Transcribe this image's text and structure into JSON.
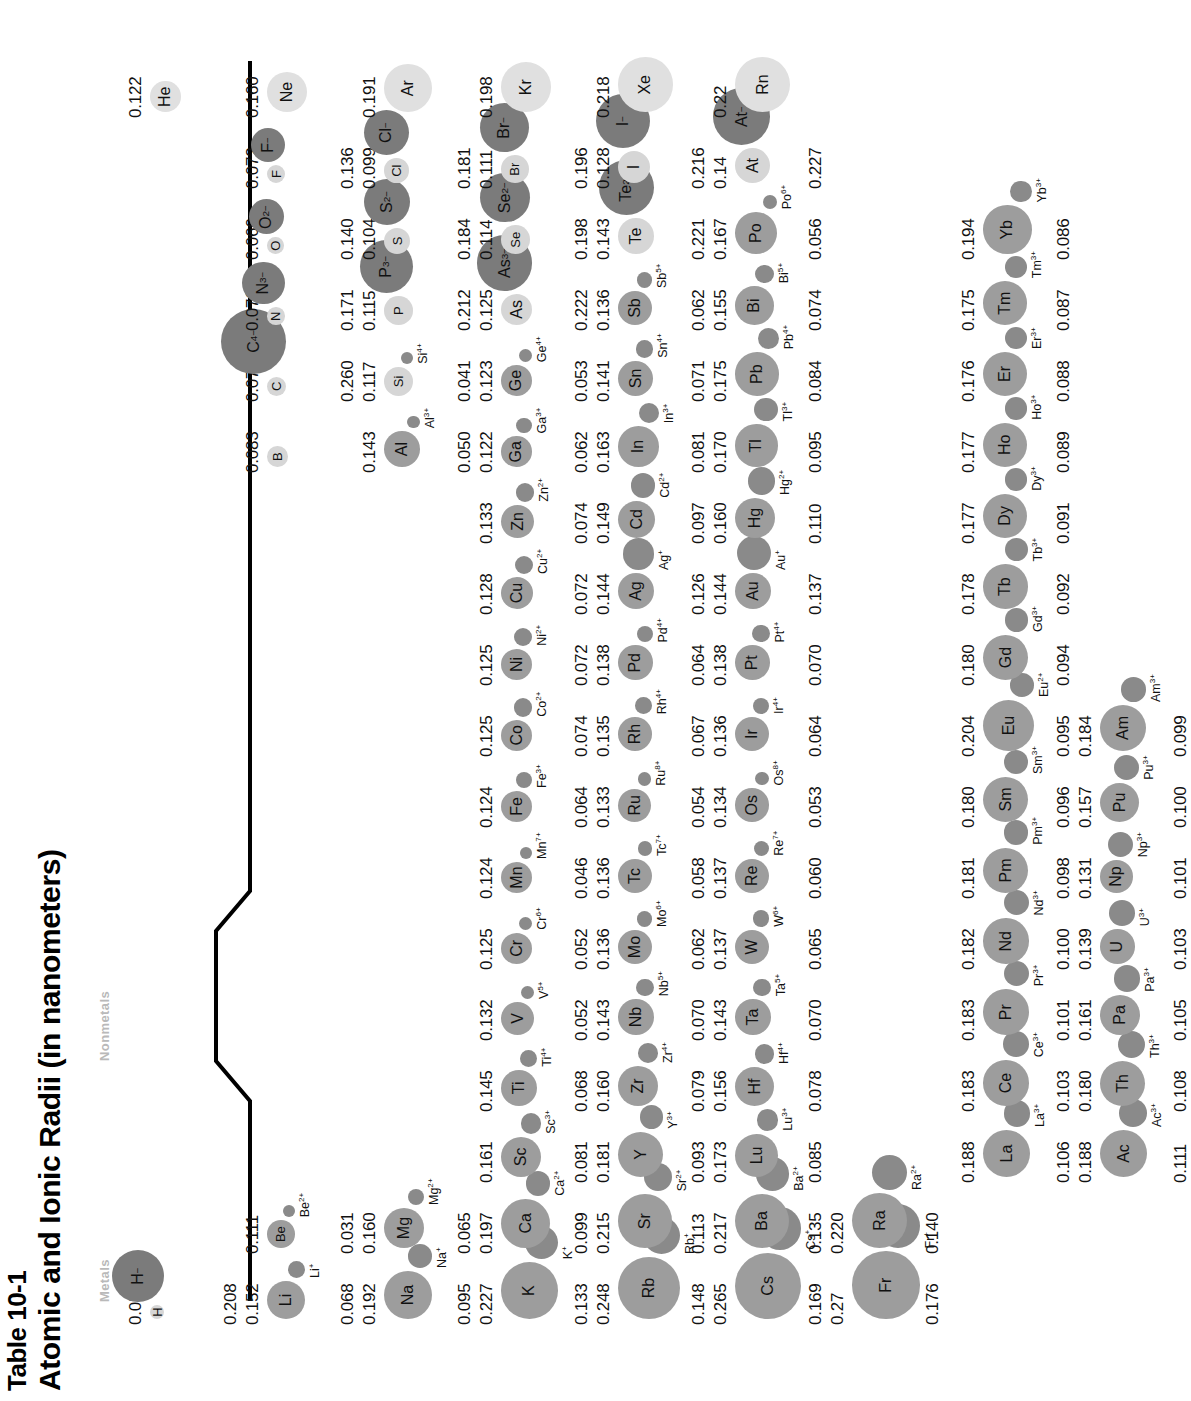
{
  "figure": {
    "table_number": "Table 10-1",
    "title": "Atomic and Ionic Radii (in nanometers)",
    "legend_metals": "Metals",
    "legend_nonmetals": "Nonmetals"
  },
  "chart_data": {
    "type": "table",
    "title": "Atomic and Ionic Radii (in nanometers)",
    "subtitle": "Table 10-1",
    "units": "nanometers",
    "legend": [
      "Metals",
      "Nonmetals"
    ],
    "encoding": {
      "atom_circle": "atomic radius (area/diameter proportional)",
      "ion_circle": "ionic radius (area/diameter proportional)",
      "metal_fill": "#9d9d9d",
      "nonmetal_fill": "#d6d6d6",
      "noblegas_fill": "#e0e0e0",
      "cation_fill": "#8a8a8a",
      "anion_fill": "#7b7b7b"
    },
    "columns": [
      "element",
      "atomic_radius",
      "ion",
      "ionic_radius",
      "class"
    ],
    "rows": [
      {
        "element": "H",
        "atomic_radius": "0.053",
        "ion": "H−",
        "ionic_radius": "0.208",
        "class": "nonmetal"
      },
      {
        "element": "He",
        "atomic_radius": "0.122",
        "ion": "",
        "ionic_radius": "",
        "class": "noblegas"
      },
      {
        "element": "Li",
        "atomic_radius": "0.152",
        "ion": "Li+",
        "ionic_radius": "0.068",
        "class": "metal"
      },
      {
        "element": "Be",
        "atomic_radius": "0.111",
        "ion": "Be2+",
        "ionic_radius": "0.031",
        "class": "metal"
      },
      {
        "element": "B",
        "atomic_radius": "0.083",
        "ion": "",
        "ionic_radius": "",
        "class": "nonmetal"
      },
      {
        "element": "C",
        "atomic_radius": "0.077",
        "ion": "C4−",
        "ionic_radius": "0.260",
        "class": "nonmetal"
      },
      {
        "element": "N",
        "atomic_radius": "0.070",
        "ion": "N3−",
        "ionic_radius": "0.171",
        "class": "nonmetal"
      },
      {
        "element": "O",
        "atomic_radius": "0.066",
        "ion": "O2−",
        "ionic_radius": "0.140",
        "class": "nonmetal"
      },
      {
        "element": "F",
        "atomic_radius": "0.072",
        "ion": "F−",
        "ionic_radius": "0.136",
        "class": "nonmetal"
      },
      {
        "element": "Ne",
        "atomic_radius": "0.160",
        "ion": "",
        "ionic_radius": "",
        "class": "noblegas"
      },
      {
        "element": "Na",
        "atomic_radius": "0.192",
        "ion": "Na+",
        "ionic_radius": "0.095",
        "class": "metal"
      },
      {
        "element": "Mg",
        "atomic_radius": "0.160",
        "ion": "Mg2+",
        "ionic_radius": "0.065",
        "class": "metal"
      },
      {
        "element": "Al",
        "atomic_radius": "0.143",
        "ion": "Al3+",
        "ionic_radius": "0.050",
        "class": "metal"
      },
      {
        "element": "Si",
        "atomic_radius": "0.117",
        "ion": "Si4+",
        "ionic_radius": "0.041",
        "class": "nonmetal"
      },
      {
        "element": "P",
        "atomic_radius": "0.115",
        "ion": "P3−",
        "ionic_radius": "0.212",
        "class": "nonmetal"
      },
      {
        "element": "S",
        "atomic_radius": "0.104",
        "ion": "S2−",
        "ionic_radius": "0.184",
        "class": "nonmetal"
      },
      {
        "element": "Cl",
        "atomic_radius": "0.099",
        "ion": "Cl−",
        "ionic_radius": "0.181",
        "class": "nonmetal"
      },
      {
        "element": "Ar",
        "atomic_radius": "0.191",
        "ion": "",
        "ionic_radius": "",
        "class": "noblegas"
      },
      {
        "element": "K",
        "atomic_radius": "0.227",
        "ion": "K+",
        "ionic_radius": "0.133",
        "class": "metal"
      },
      {
        "element": "Ca",
        "atomic_radius": "0.197",
        "ion": "Ca2+",
        "ionic_radius": "0.099",
        "class": "metal"
      },
      {
        "element": "Sc",
        "atomic_radius": "0.161",
        "ion": "Sc3+",
        "ionic_radius": "0.081",
        "class": "metal"
      },
      {
        "element": "Ti",
        "atomic_radius": "0.145",
        "ion": "Ti4+",
        "ionic_radius": "0.068",
        "class": "metal"
      },
      {
        "element": "V",
        "atomic_radius": "0.132",
        "ion": "V5+",
        "ionic_radius": "0.052",
        "class": "metal"
      },
      {
        "element": "Cr",
        "atomic_radius": "0.125",
        "ion": "Cr6+",
        "ionic_radius": "0.052",
        "class": "metal"
      },
      {
        "element": "Mn",
        "atomic_radius": "0.124",
        "ion": "Mn7+",
        "ionic_radius": "0.046",
        "class": "metal"
      },
      {
        "element": "Fe",
        "atomic_radius": "0.124",
        "ion": "Fe3+",
        "ionic_radius": "0.064",
        "class": "metal"
      },
      {
        "element": "Co",
        "atomic_radius": "0.125",
        "ion": "Co2+",
        "ionic_radius": "0.074",
        "class": "metal"
      },
      {
        "element": "Ni",
        "atomic_radius": "0.125",
        "ion": "Ni2+",
        "ionic_radius": "0.072",
        "class": "metal"
      },
      {
        "element": "Cu",
        "atomic_radius": "0.128",
        "ion": "Cu2+",
        "ionic_radius": "0.072",
        "class": "metal"
      },
      {
        "element": "Zn",
        "atomic_radius": "0.133",
        "ion": "Zn2+",
        "ionic_radius": "0.074",
        "class": "metal"
      },
      {
        "element": "Ga",
        "atomic_radius": "0.122",
        "ion": "Ga3+",
        "ionic_radius": "0.062",
        "class": "metal"
      },
      {
        "element": "Ge",
        "atomic_radius": "0.123",
        "ion": "Ge4+",
        "ionic_radius": "0.053",
        "class": "metal"
      },
      {
        "element": "As",
        "atomic_radius": "0.125",
        "ion": "As3−",
        "ionic_radius": "0.222",
        "class": "nonmetal"
      },
      {
        "element": "Se",
        "atomic_radius": "0.114",
        "ion": "Se2−",
        "ionic_radius": "0.198",
        "class": "nonmetal"
      },
      {
        "element": "Br",
        "atomic_radius": "0.111",
        "ion": "Br−",
        "ionic_radius": "0.196",
        "class": "nonmetal"
      },
      {
        "element": "Kr",
        "atomic_radius": "0.198",
        "ion": "",
        "ionic_radius": "",
        "class": "noblegas"
      },
      {
        "element": "Rb",
        "atomic_radius": "0.248",
        "ion": "Rb+",
        "ionic_radius": "0.148",
        "class": "metal"
      },
      {
        "element": "Sr",
        "atomic_radius": "0.215",
        "ion": "Sr2+",
        "ionic_radius": "0.113",
        "class": "metal"
      },
      {
        "element": "Y",
        "atomic_radius": "0.181",
        "ion": "Y3+",
        "ionic_radius": "0.093",
        "class": "metal"
      },
      {
        "element": "Zr",
        "atomic_radius": "0.160",
        "ion": "Zr4+",
        "ionic_radius": "0.079",
        "class": "metal"
      },
      {
        "element": "Nb",
        "atomic_radius": "0.143",
        "ion": "Nb5+",
        "ionic_radius": "0.070",
        "class": "metal"
      },
      {
        "element": "Mo",
        "atomic_radius": "0.136",
        "ion": "Mo6+",
        "ionic_radius": "0.062",
        "class": "metal"
      },
      {
        "element": "Tc",
        "atomic_radius": "0.136",
        "ion": "Tc7+",
        "ionic_radius": "0.058",
        "class": "metal"
      },
      {
        "element": "Ru",
        "atomic_radius": "0.133",
        "ion": "Ru8+",
        "ionic_radius": "0.054",
        "class": "metal"
      },
      {
        "element": "Rh",
        "atomic_radius": "0.135",
        "ion": "Rh4+",
        "ionic_radius": "0.067",
        "class": "metal"
      },
      {
        "element": "Pd",
        "atomic_radius": "0.138",
        "ion": "Pd4+",
        "ionic_radius": "0.064",
        "class": "metal"
      },
      {
        "element": "Ag",
        "atomic_radius": "0.144",
        "ion": "Ag+",
        "ionic_radius": "0.126",
        "class": "metal"
      },
      {
        "element": "Cd",
        "atomic_radius": "0.149",
        "ion": "Cd2+",
        "ionic_radius": "0.097",
        "class": "metal"
      },
      {
        "element": "In",
        "atomic_radius": "0.163",
        "ion": "In3+",
        "ionic_radius": "0.081",
        "class": "metal"
      },
      {
        "element": "Sn",
        "atomic_radius": "0.141",
        "ion": "Sn4+",
        "ionic_radius": "0.071",
        "class": "metal"
      },
      {
        "element": "Sb",
        "atomic_radius": "0.136",
        "ion": "Sb5+",
        "ionic_radius": "0.062",
        "class": "metal"
      },
      {
        "element": "Te",
        "atomic_radius": "0.143",
        "ion": "Te2−",
        "ionic_radius": "0.221",
        "class": "nonmetal"
      },
      {
        "element": "I",
        "atomic_radius": "0.128",
        "ion": "I−",
        "ionic_radius": "0.216",
        "class": "nonmetal"
      },
      {
        "element": "Xe",
        "atomic_radius": "0.218",
        "ion": "",
        "ionic_radius": "",
        "class": "noblegas"
      },
      {
        "element": "Cs",
        "atomic_radius": "0.265",
        "ion": "Cs+",
        "ionic_radius": "0.169",
        "class": "metal"
      },
      {
        "element": "Ba",
        "atomic_radius": "0.217",
        "ion": "Ba2+",
        "ionic_radius": "0.135",
        "class": "metal"
      },
      {
        "element": "Lu",
        "atomic_radius": "0.173",
        "ion": "Lu3+",
        "ionic_radius": "0.085",
        "class": "metal"
      },
      {
        "element": "Hf",
        "atomic_radius": "0.156",
        "ion": "Hf4+",
        "ionic_radius": "0.078",
        "class": "metal"
      },
      {
        "element": "Ta",
        "atomic_radius": "0.143",
        "ion": "Ta5+",
        "ionic_radius": "0.070",
        "class": "metal"
      },
      {
        "element": "W",
        "atomic_radius": "0.137",
        "ion": "W6+",
        "ionic_radius": "0.065",
        "class": "metal"
      },
      {
        "element": "Re",
        "atomic_radius": "0.137",
        "ion": "Re7+",
        "ionic_radius": "0.060",
        "class": "metal"
      },
      {
        "element": "Os",
        "atomic_radius": "0.134",
        "ion": "Os8+",
        "ionic_radius": "0.053",
        "class": "metal"
      },
      {
        "element": "Ir",
        "atomic_radius": "0.136",
        "ion": "Ir4+",
        "ionic_radius": "0.064",
        "class": "metal"
      },
      {
        "element": "Pt",
        "atomic_radius": "0.138",
        "ion": "Pt4+",
        "ionic_radius": "0.070",
        "class": "metal"
      },
      {
        "element": "Au",
        "atomic_radius": "0.144",
        "ion": "Au+",
        "ionic_radius": "0.137",
        "class": "metal"
      },
      {
        "element": "Hg",
        "atomic_radius": "0.160",
        "ion": "Hg2+",
        "ionic_radius": "0.110",
        "class": "metal"
      },
      {
        "element": "Tl",
        "atomic_radius": "0.170",
        "ion": "Tl3+",
        "ionic_radius": "0.095",
        "class": "metal"
      },
      {
        "element": "Pb",
        "atomic_radius": "0.175",
        "ion": "Pb4+",
        "ionic_radius": "0.084",
        "class": "metal"
      },
      {
        "element": "Bi",
        "atomic_radius": "0.155",
        "ion": "Bi5+",
        "ionic_radius": "0.074",
        "class": "metal"
      },
      {
        "element": "Po",
        "atomic_radius": "0.167",
        "ion": "Po6+",
        "ionic_radius": "0.056",
        "class": "metal"
      },
      {
        "element": "At",
        "atomic_radius": "0.14",
        "ion": "At−",
        "ionic_radius": "0.227",
        "class": "nonmetal"
      },
      {
        "element": "Rn",
        "atomic_radius": "0.22",
        "ion": "",
        "ionic_radius": "",
        "class": "noblegas"
      },
      {
        "element": "Fr",
        "atomic_radius": "0.27",
        "ion": "Fr+",
        "ionic_radius": "0.176",
        "class": "metal"
      },
      {
        "element": "Ra",
        "atomic_radius": "0.220",
        "ion": "Ra2+",
        "ionic_radius": "0.140",
        "class": "metal"
      },
      {
        "element": "La",
        "atomic_radius": "0.188",
        "ion": "La3+",
        "ionic_radius": "0.106",
        "class": "metal"
      },
      {
        "element": "Ce",
        "atomic_radius": "0.183",
        "ion": "Ce3+",
        "ionic_radius": "0.103",
        "class": "metal"
      },
      {
        "element": "Pr",
        "atomic_radius": "0.183",
        "ion": "Pr3+",
        "ionic_radius": "0.101",
        "class": "metal"
      },
      {
        "element": "Nd",
        "atomic_radius": "0.182",
        "ion": "Nd3+",
        "ionic_radius": "0.100",
        "class": "metal"
      },
      {
        "element": "Pm",
        "atomic_radius": "0.181",
        "ion": "Pm3+",
        "ionic_radius": "0.098",
        "class": "metal"
      },
      {
        "element": "Sm",
        "atomic_radius": "0.180",
        "ion": "Sm3+",
        "ionic_radius": "0.096",
        "class": "metal"
      },
      {
        "element": "Eu",
        "atomic_radius": "0.204",
        "ion": "Eu2+",
        "ionic_radius": "0.095",
        "class": "metal"
      },
      {
        "element": "Gd",
        "atomic_radius": "0.180",
        "ion": "Gd3+",
        "ionic_radius": "0.094",
        "class": "metal"
      },
      {
        "element": "Tb",
        "atomic_radius": "0.178",
        "ion": "Tb3+",
        "ionic_radius": "0.092",
        "class": "metal"
      },
      {
        "element": "Dy",
        "atomic_radius": "0.177",
        "ion": "Dy3+",
        "ionic_radius": "0.091",
        "class": "metal"
      },
      {
        "element": "Ho",
        "atomic_radius": "0.177",
        "ion": "Ho3+",
        "ionic_radius": "0.089",
        "class": "metal"
      },
      {
        "element": "Er",
        "atomic_radius": "0.176",
        "ion": "Er3+",
        "ionic_radius": "0.088",
        "class": "metal"
      },
      {
        "element": "Tm",
        "atomic_radius": "0.175",
        "ion": "Tm3+",
        "ionic_radius": "0.087",
        "class": "metal"
      },
      {
        "element": "Yb",
        "atomic_radius": "0.194",
        "ion": "Yb3+",
        "ionic_radius": "0.086",
        "class": "metal"
      },
      {
        "element": "Ac",
        "atomic_radius": "0.188",
        "ion": "Ac3+",
        "ionic_radius": "0.111",
        "class": "metal"
      },
      {
        "element": "Th",
        "atomic_radius": "0.180",
        "ion": "Th3+",
        "ionic_radius": "0.108",
        "class": "metal"
      },
      {
        "element": "Pa",
        "atomic_radius": "0.161",
        "ion": "Pa3+",
        "ionic_radius": "0.105",
        "class": "metal"
      },
      {
        "element": "U",
        "atomic_radius": "0.139",
        "ion": "U3+",
        "ionic_radius": "0.103",
        "class": "metal"
      },
      {
        "element": "Np",
        "atomic_radius": "0.131",
        "ion": "Np3+",
        "ionic_radius": "0.101",
        "class": "metal"
      },
      {
        "element": "Pu",
        "atomic_radius": "0.157",
        "ion": "Pu3+",
        "ionic_radius": "0.100",
        "class": "metal"
      },
      {
        "element": "Am",
        "atomic_radius": "0.184",
        "ion": "Am3+",
        "ionic_radius": "0.099",
        "class": "metal"
      }
    ]
  }
}
